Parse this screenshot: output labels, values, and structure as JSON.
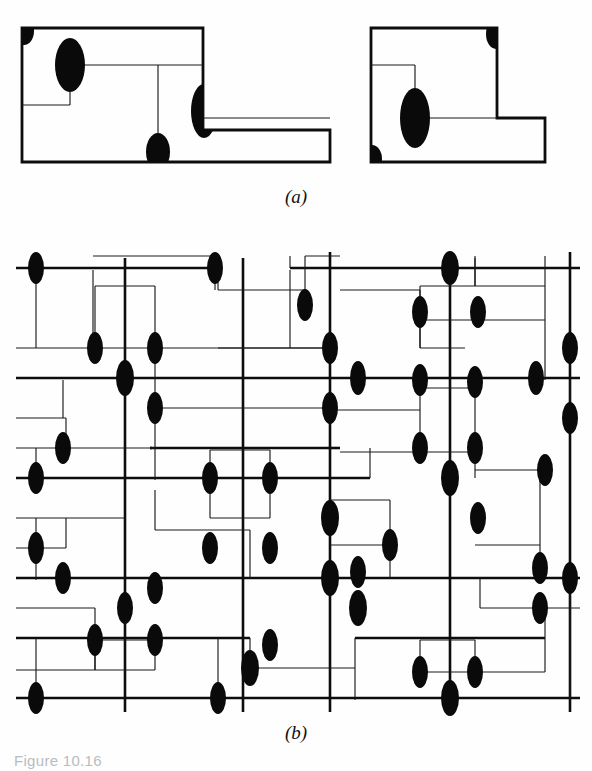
{
  "figure": {
    "caption": "Figure 10.16",
    "panels": [
      {
        "id": "a",
        "label": "(a)"
      },
      {
        "id": "b",
        "label": "(b)"
      }
    ]
  },
  "colors": {
    "ink": "#0d0d0d",
    "via_fill": "#0a0a0a",
    "background": "#ffffff",
    "caption_faded": "#b9bcbe"
  },
  "panel_a": {
    "description": "Two routed polygon outlines with vias marked as filled black ellipses",
    "shapes": [
      {
        "name": "left-outline",
        "points": "22,28 203,28 203,130 330,130 330,162 22,162"
      },
      {
        "name": "right-outline",
        "points": "371,28 497,28 497,118 545,118 545,162 371,162"
      }
    ],
    "wires": [
      {
        "name": "left-inner-horizontal-upper",
        "path": "M 70,65 L 203,65"
      },
      {
        "name": "left-inner-vertical-from-via1",
        "path": "M 70,65 L 70,105"
      },
      {
        "name": "left-inner-horizontal-lower",
        "path": "M 22,105 L 70,105"
      },
      {
        "name": "left-inner-vertical-center",
        "path": "M 158,65 L 158,148"
      },
      {
        "name": "left-inner-horizontal-right",
        "path": "M 203,118 L 330,118"
      },
      {
        "name": "right-inner-horizontal-upper",
        "path": "M 371,65 L 415,65"
      },
      {
        "name": "right-inner-vertical",
        "path": "M 415,65 L 415,118"
      },
      {
        "name": "right-inner-horizontal-mid",
        "path": "M 415,118 L 497,118"
      },
      {
        "name": "right-inner-vertical-corner",
        "path": "M 497,28 L 497,118"
      }
    ],
    "vias": [
      {
        "name": "via-left-topleft-corner",
        "cx": 25,
        "cy": 33,
        "rx": 9,
        "ry": 13,
        "clip": "corner"
      },
      {
        "name": "via-left-upper",
        "cx": 70,
        "cy": 65,
        "rx": 15,
        "ry": 27
      },
      {
        "name": "via-left-bottom",
        "cx": 158,
        "cy": 148,
        "rx": 12,
        "ry": 17,
        "clip": "bottom"
      },
      {
        "name": "via-left-right-mid",
        "cx": 203,
        "cy": 110,
        "rx": 13,
        "ry": 26
      },
      {
        "name": "via-right-topright-corner",
        "cx": 493,
        "cy": 36,
        "rx": 9,
        "ry": 14,
        "clip": "corner"
      },
      {
        "name": "via-right-center",
        "cx": 415,
        "cy": 118,
        "rx": 15,
        "ry": 29
      },
      {
        "name": "via-right-bottomleft-corner",
        "cx": 375,
        "cy": 152,
        "rx": 9,
        "ry": 13,
        "clip": "corner"
      }
    ]
  },
  "panel_b": {
    "description": "Routing grid: thick bus lines, thin detour wires, filled black ellipse vias at junctions",
    "grid": {
      "columns_thick": [
        125,
        243,
        330,
        450,
        570
      ],
      "rows_thick": [
        268,
        378,
        478,
        578,
        698
      ],
      "rows_thin": [
        348,
        418,
        488,
        528,
        608,
        668
      ],
      "x_min": 16,
      "x_max": 580,
      "y_min": 252,
      "y_max": 712
    },
    "via_count": 56
  }
}
